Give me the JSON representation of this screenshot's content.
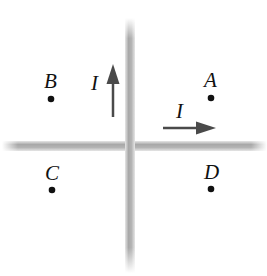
{
  "diagram": {
    "wires": [
      {
        "id": "vertical",
        "current_label": "I",
        "direction": "up"
      },
      {
        "id": "horizontal",
        "current_label": "I",
        "direction": "right"
      }
    ],
    "points": [
      {
        "label": "A",
        "quadrant": "upper-right"
      },
      {
        "label": "B",
        "quadrant": "upper-left"
      },
      {
        "label": "C",
        "quadrant": "lower-left"
      },
      {
        "label": "D",
        "quadrant": "lower-right"
      }
    ],
    "colors": {
      "wire": "#b8b8b8",
      "arrow": "#4a4a4a",
      "text": "#111111"
    }
  }
}
